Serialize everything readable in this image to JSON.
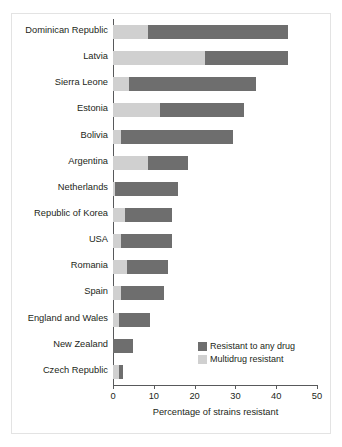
{
  "chart_data": {
    "type": "bar",
    "orientation": "horizontal",
    "stacked": true,
    "title": "",
    "xlabel": "Percentage of strains resistant",
    "ylabel": "",
    "xlim": [
      0,
      50
    ],
    "xticks": [
      0,
      10,
      20,
      30,
      40,
      50
    ],
    "xtick_labels": [
      "0",
      "10",
      "20",
      "30",
      "40",
      "50"
    ],
    "grid": false,
    "legend_position": "lower-right-inside",
    "categories": [
      "Dominican Republic",
      "Latvia",
      "Sierra Leone",
      "Estonia",
      "Bolivia",
      "Argentina",
      "Netherlands",
      "Republic of Korea",
      "USA",
      "Romania",
      "Spain",
      "England and Wales",
      "New Zealand",
      "Czech Republic"
    ],
    "series": [
      {
        "name": "Multidrug resistant",
        "color": "#d0d0d0",
        "values": [
          8.5,
          22.5,
          4.0,
          11.5,
          2.0,
          8.5,
          0.6,
          3.0,
          2.0,
          3.5,
          2.0,
          1.5,
          0.0,
          1.5
        ]
      },
      {
        "name": "Resistant to any drug",
        "color": "#6e6e6e",
        "values": [
          34.5,
          20.5,
          31.0,
          20.5,
          27.5,
          10.0,
          15.4,
          11.5,
          12.5,
          10.0,
          10.5,
          7.5,
          5.0,
          1.0
        ]
      }
    ],
    "totals": [
      43.0,
      43.0,
      35.0,
      32.0,
      29.5,
      18.5,
      16.0,
      14.5,
      14.5,
      13.5,
      12.5,
      9.0,
      5.0,
      2.5
    ],
    "legend": [
      {
        "label": "Resistant to any drug",
        "swatch": "any"
      },
      {
        "label": "Multidrug resistant",
        "swatch": "multi"
      }
    ],
    "colors": {
      "multidrug_resistant": "#d0d0d0",
      "resistant_any_drug": "#6e6e6e",
      "axis": "#58595b",
      "text": "#231f20",
      "frame": "#e3e3e3"
    }
  }
}
